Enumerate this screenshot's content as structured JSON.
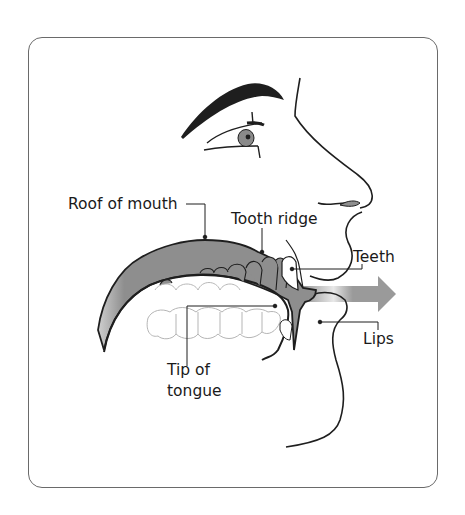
{
  "diagram": {
    "labels": {
      "roof_of_mouth": "Roof of mouth",
      "tooth_ridge": "Tooth ridge",
      "teeth": "Teeth",
      "lips": "Lips",
      "tip_of_tongue_line1": "Tip of",
      "tip_of_tongue_line2": "tongue"
    },
    "colors": {
      "outline": "#1e1e1e",
      "mouth_fill": "#8e8e8e",
      "airflow_arrow": "#9a9a9a",
      "frame_border": "#6a6a6a",
      "teeth_outline": "#b5b5b5",
      "label_text": "#1a1a1a"
    },
    "airflow_direction": "right"
  }
}
